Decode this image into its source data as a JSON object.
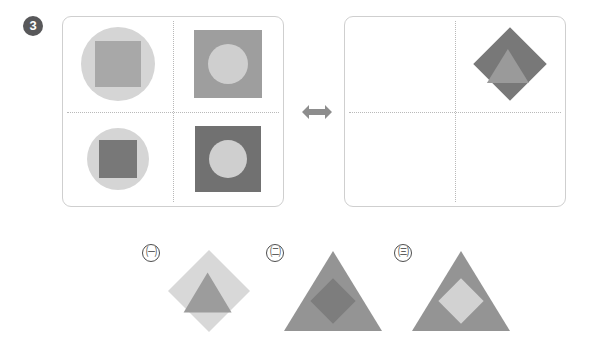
{
  "question": {
    "number": "3",
    "badge_color": "#58585a"
  },
  "palette": {
    "light_gray": "#d5d5d5",
    "lighter_gray": "#dcdcdc",
    "mid_gray": "#a0a0a0",
    "medium_gray": "#949494",
    "dark_gray": "#7a7a7a",
    "darker_gray": "#6e6e6e",
    "panel_border": "#cfcfcf",
    "divider": "#b9b9b9",
    "arrow": "#8d8d8d"
  },
  "panels": {
    "left": {
      "name": "left-pattern-panel",
      "quadrants": [
        {
          "position": "top-left",
          "outer_shape": "circle",
          "outer_color": "#d5d5d5",
          "outer_size": 74,
          "inner_shape": "square",
          "inner_color": "#a8a8a8",
          "inner_size": 46
        },
        {
          "position": "top-right",
          "outer_shape": "square",
          "outer_color": "#9e9e9e",
          "outer_size": 68,
          "inner_shape": "circle",
          "inner_color": "#cfcfcf",
          "inner_size": 40
        },
        {
          "position": "bottom-left",
          "outer_shape": "circle",
          "outer_color": "#d5d5d5",
          "outer_size": 62,
          "inner_shape": "square",
          "inner_color": "#787878",
          "inner_size": 38
        },
        {
          "position": "bottom-right",
          "outer_shape": "square",
          "outer_color": "#717171",
          "outer_size": 66,
          "inner_shape": "circle",
          "inner_color": "#cfcfcf",
          "inner_size": 38
        }
      ]
    },
    "right": {
      "name": "right-pattern-panel",
      "quadrants": [
        {
          "position": "top-left",
          "outer_shape": "empty"
        },
        {
          "position": "top-right",
          "outer_shape": "diamond",
          "outer_color": "#787878",
          "outer_size": 52,
          "inner_shape": "triangle",
          "inner_color": "#9a9a9a",
          "inner_size": 34
        },
        {
          "position": "bottom-left",
          "outer_shape": "empty"
        },
        {
          "position": "bottom-right",
          "outer_shape": "empty"
        }
      ]
    }
  },
  "arrow": {
    "name": "exchange-arrow",
    "direction": "left-right",
    "color": "#8d8d8d"
  },
  "options": [
    {
      "label": "㈠",
      "outer_shape": "diamond",
      "outer_color": "#d8d8d8",
      "outer_size": 58,
      "inner_shape": "triangle",
      "inner_color": "#9c9c9c",
      "inner_size": 40
    },
    {
      "label": "㈡",
      "outer_shape": "triangle",
      "outer_color": "#949494",
      "outer_size": 80,
      "inner_shape": "diamond",
      "inner_color": "#7d7d7d",
      "inner_size": 32
    },
    {
      "label": "㈢",
      "outer_shape": "triangle",
      "outer_color": "#949494",
      "outer_size": 80,
      "inner_shape": "diamond",
      "inner_color": "#d2d2d2",
      "inner_size": 32
    }
  ]
}
